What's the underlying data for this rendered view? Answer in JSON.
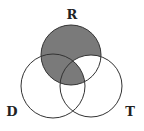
{
  "diagram": {
    "type": "venn-3",
    "colors": {
      "shade": "#7a7a7a",
      "stroke": "#333333",
      "background": "#ffffff"
    },
    "sets": [
      {
        "id": "R",
        "label": "R",
        "cx": 71,
        "cy": 55,
        "r": 30
      },
      {
        "id": "D",
        "label": "D",
        "cx": 53,
        "cy": 86,
        "r": 32
      },
      {
        "id": "T",
        "label": "T",
        "cx": 91,
        "cy": 86,
        "r": 31
      }
    ],
    "shaded_regions": [
      "R only",
      "R∩D only",
      "R∩D∩T"
    ],
    "unshaded_regions": [
      "R∩T only",
      "D only",
      "T only",
      "D∩T only"
    ]
  }
}
